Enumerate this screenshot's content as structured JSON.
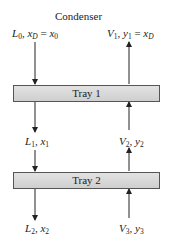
{
  "title": "Condenser",
  "trays": [
    {
      "label": "Tray 1"
    },
    {
      "label": "Tray 2"
    }
  ],
  "streams": {
    "top_liquid": {
      "flow": "L",
      "flow_sub": "0",
      "comp": "x",
      "comp_sub": "D",
      "eq": "=",
      "rhs": "x",
      "rhs_sub": "0"
    },
    "top_vapor": {
      "flow": "V",
      "flow_sub": "1",
      "comp": "y",
      "comp_sub": "1",
      "eq": "=",
      "rhs": "x",
      "rhs_sub": "D"
    },
    "liquid_1": {
      "flow": "L",
      "flow_sub": "1",
      "comp": "x",
      "comp_sub": "1"
    },
    "vapor_2": {
      "flow": "V",
      "flow_sub": "2",
      "comp": "y",
      "comp_sub": "2"
    },
    "liquid_2": {
      "flow": "L",
      "flow_sub": "2",
      "comp": "x",
      "comp_sub": "2"
    },
    "vapor_3": {
      "flow": "V",
      "flow_sub": "3",
      "comp": "y",
      "comp_sub": "3"
    }
  }
}
